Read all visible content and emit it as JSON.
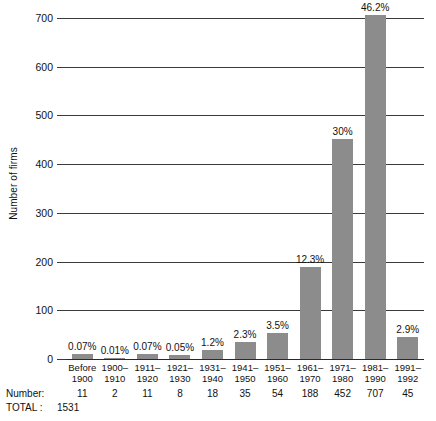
{
  "chart_data": {
    "type": "bar",
    "title": "",
    "subtitle": "",
    "xlabel": "",
    "ylabel": "Number of firms",
    "ylim": [
      0,
      700
    ],
    "yticks": [
      0,
      100,
      200,
      300,
      400,
      500,
      600,
      700
    ],
    "ytick_labels": [
      "0",
      "100",
      "200",
      "300",
      "400",
      "500",
      "600",
      "700"
    ],
    "grid": true,
    "legend": "none",
    "categories": [
      "Before\n1900",
      "1900–\n1910",
      "1911–\n1920",
      "1921–\n1930",
      "1931–\n1940",
      "1941–\n1950",
      "1951–\n1960",
      "1961–\n1970",
      "1971–\n1980",
      "1981–\n1990",
      "1991–\n1992"
    ],
    "category_lines": [
      [
        "Before",
        "1900"
      ],
      [
        "1900–",
        "1910"
      ],
      [
        "1911–",
        "1920"
      ],
      [
        "1921–",
        "1930"
      ],
      [
        "1931–",
        "1940"
      ],
      [
        "1941–",
        "1950"
      ],
      [
        "1951–",
        "1960"
      ],
      [
        "1961–",
        "1970"
      ],
      [
        "1971–",
        "1980"
      ],
      [
        "1981–",
        "1990"
      ],
      [
        "1991–",
        "1992"
      ]
    ],
    "values": [
      11,
      2,
      11,
      8,
      18,
      35,
      54,
      188,
      452,
      707,
      45
    ],
    "value_labels": [
      "0.07%",
      "0.01%",
      "0.07%",
      "0.05%",
      "1.2%",
      "2.3%",
      "3.5%",
      "12.3%",
      "30%",
      "46.2%",
      "2.9%"
    ],
    "number_row_label": "Number:",
    "number_row_values": [
      "11",
      "2",
      "11",
      "8",
      "18",
      "35",
      "54",
      "188",
      "452",
      "707",
      "45"
    ],
    "total_label": "TOTAL :",
    "total_value": "1531"
  },
  "style": {
    "bar_color": "#8c8c8c",
    "grid_color": "#3a3a3a",
    "text_color": "#111111",
    "background": "#ffffff"
  }
}
